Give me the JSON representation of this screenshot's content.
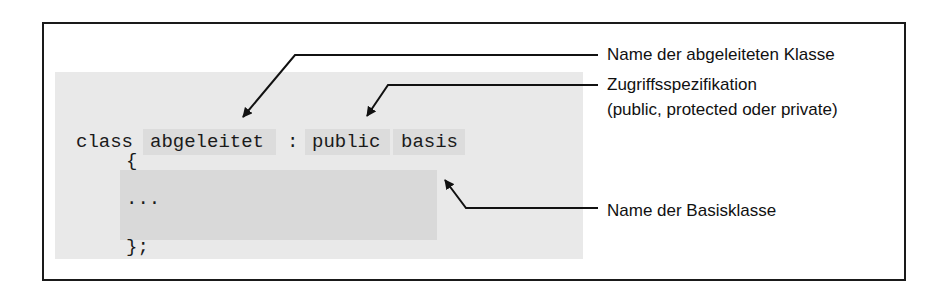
{
  "code": {
    "line1": {
      "keyword": "class",
      "derived": "abgeleitet",
      "colon": ":",
      "access": "public",
      "base": "basis"
    },
    "open_brace": "{",
    "ellipsis": "...",
    "close_brace": "};"
  },
  "annotations": [
    {
      "text": "Name der abgeleiteten Klasse"
    },
    {
      "text": "Zugriffsspezifikation"
    },
    {
      "text": "(public, protected oder private)"
    },
    {
      "text": "Name der Basisklasse"
    }
  ],
  "colors": {
    "frame": "#1a1a1a",
    "code_background": "#e9e9e9",
    "highlight": "#dcdcdc",
    "body_block": "#d9d9d9",
    "text": "#111111"
  }
}
